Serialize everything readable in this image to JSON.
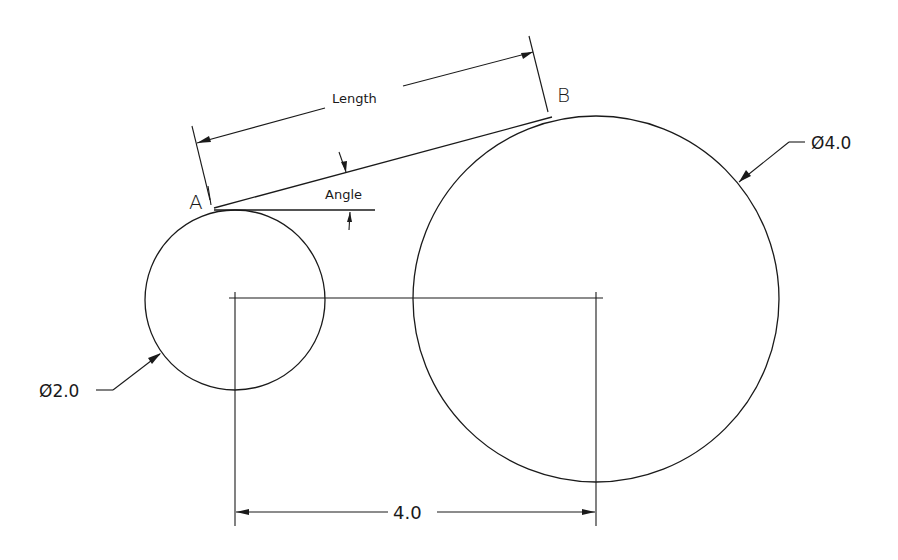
{
  "diagram": {
    "type": "cad-dimension-drawing",
    "background": "#ffffff",
    "line_color": "#1a1a1a",
    "points": {
      "a": {
        "label": "A"
      },
      "b": {
        "label": "B"
      }
    },
    "labels": {
      "length": "Length",
      "angle": "Angle"
    },
    "dimensions": {
      "small_circle_diameter": "Ø2.0",
      "large_circle_diameter": "Ø4.0",
      "center_distance": "4.0"
    },
    "shapes": {
      "small_circle": {
        "diameter": 2.0
      },
      "large_circle": {
        "diameter": 4.0
      },
      "center_distance": 4.0
    }
  }
}
